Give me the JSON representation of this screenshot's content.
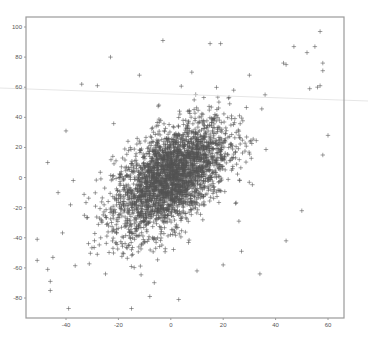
{
  "chart_data": {
    "type": "scatter",
    "title": "",
    "xlabel": "",
    "ylabel": "",
    "xlim": [
      -52,
      66
    ],
    "ylim": [
      -94,
      106
    ],
    "x_ticks": [
      -40,
      -20,
      0,
      20,
      40,
      60
    ],
    "y_ticks": [
      -80,
      -60,
      -40,
      -20,
      0,
      20,
      40,
      60,
      80,
      100
    ],
    "grid": false,
    "legend": null,
    "marker": "+",
    "marker_color": "#555555",
    "distribution": {
      "description": "Bivariate cloud of ~3000 points, positively correlated, centered near (0, 0)",
      "n_points_approx": 3000,
      "mean_x": 0,
      "mean_y": 0,
      "std_x": 11,
      "std_y": 19,
      "correlation": 0.55
    },
    "outliers": [
      {
        "x": 57,
        "y": 97
      },
      {
        "x": 47,
        "y": 87
      },
      {
        "x": 55,
        "y": 87
      },
      {
        "x": 52,
        "y": 83
      },
      {
        "x": 58,
        "y": 76
      },
      {
        "x": 58,
        "y": 71
      },
      {
        "x": 53,
        "y": 59
      },
      {
        "x": 56,
        "y": 60
      },
      {
        "x": 57,
        "y": 61
      },
      {
        "x": 43,
        "y": 76
      },
      {
        "x": 44,
        "y": 75
      },
      {
        "x": -3,
        "y": 91
      },
      {
        "x": 15,
        "y": 89
      },
      {
        "x": 19,
        "y": 89
      },
      {
        "x": -23,
        "y": 80
      },
      {
        "x": -34,
        "y": 62
      },
      {
        "x": -28,
        "y": 61
      },
      {
        "x": -51,
        "y": -41
      },
      {
        "x": -51,
        "y": -55
      },
      {
        "x": -47,
        "y": -61
      },
      {
        "x": -46,
        "y": -69
      },
      {
        "x": -46,
        "y": -75
      },
      {
        "x": -45,
        "y": -53
      },
      {
        "x": -39,
        "y": -87
      },
      {
        "x": -15,
        "y": -87
      },
      {
        "x": -8,
        "y": -79
      },
      {
        "x": 3,
        "y": -81
      },
      {
        "x": 50,
        "y": -22
      },
      {
        "x": 44,
        "y": -42
      },
      {
        "x": 34,
        "y": -64
      },
      {
        "x": 26,
        "y": -29
      },
      {
        "x": 27,
        "y": -49
      },
      {
        "x": -47,
        "y": 10
      },
      {
        "x": 60,
        "y": 28
      },
      {
        "x": 58,
        "y": 15
      },
      {
        "x": 30,
        "y": 68
      },
      {
        "x": 8,
        "y": 70
      },
      {
        "x": -12,
        "y": 68
      },
      {
        "x": 36,
        "y": 55
      },
      {
        "x": 24,
        "y": 58
      },
      {
        "x": -40,
        "y": 31
      },
      {
        "x": -43,
        "y": -10
      },
      {
        "x": 20,
        "y": -58
      },
      {
        "x": 10,
        "y": -62
      }
    ]
  },
  "layout": {
    "plot_box": {
      "left": 26,
      "top": 17,
      "right": 344,
      "bottom": 318
    },
    "x_axis_px": {
      "-40": 66,
      "60": 328
    },
    "y_axis_px": {
      "100": 27,
      "-80": 298
    },
    "artifact_line": {
      "x1": 0,
      "y1": 88,
      "x2": 368,
      "y2": 101,
      "color": "#e6e6e6"
    }
  }
}
